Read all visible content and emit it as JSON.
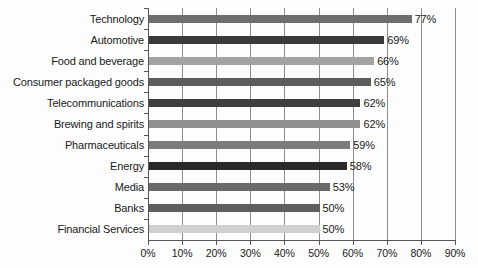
{
  "chart_data": {
    "type": "bar",
    "orientation": "horizontal",
    "title": "",
    "subtitle": "",
    "xlabel": "",
    "ylabel": "",
    "xlim": [
      0,
      90
    ],
    "grid": true,
    "legend": "none",
    "xtick_labels": [
      "0%",
      "10%",
      "20%",
      "30%",
      "40%",
      "50%",
      "60%",
      "70%",
      "80%",
      "90%"
    ],
    "xtick_values": [
      0,
      10,
      20,
      30,
      40,
      50,
      60,
      70,
      80,
      90
    ],
    "categories": [
      "Technology",
      "Automotive",
      "Food and beverage",
      "Consumer packaged goods",
      "Telecommunications",
      "Brewing and spirits",
      "Pharmaceuticals",
      "Energy",
      "Media",
      "Banks",
      "Financial Services"
    ],
    "values": [
      77,
      69,
      66,
      65,
      62,
      62,
      59,
      58,
      53,
      50,
      50
    ],
    "value_labels": [
      "77%",
      "69%",
      "66%",
      "65%",
      "62%",
      "62%",
      "59%",
      "58%",
      "53%",
      "50%",
      "50%"
    ],
    "bar_colors": [
      "#6e6e6e",
      "#3a3a3a",
      "#a3a3a3",
      "#5c5c5c",
      "#3f3f3f",
      "#8f8f8f",
      "#7b7b7b",
      "#2a2a2a",
      "#6a6a6a",
      "#5f5f5f",
      "#cfcfcf"
    ]
  },
  "colors": {
    "axis": "#565656",
    "gridline": "#8d8d8d",
    "text": "#1a1a1a",
    "background": "#fdfdfd"
  }
}
